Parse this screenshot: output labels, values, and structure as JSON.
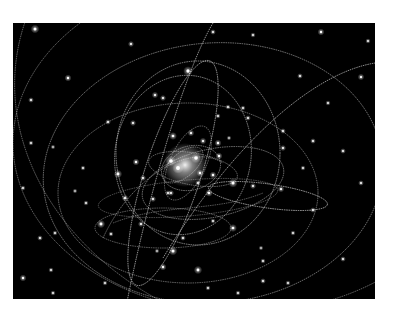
{
  "image": {
    "description": "Simulated stellar orbits around a central galactic black hole, with star trails on a black background",
    "background_color": "#000000",
    "page_color": "#ffffff",
    "frame": {
      "x": 13,
      "y": 23,
      "width": 362,
      "height": 276
    },
    "colors": {
      "orbit": "#cfcfcf",
      "star": "#ffffff",
      "glow": "#ffffff"
    },
    "core": {
      "cx": 172,
      "cy": 142,
      "r": 22
    },
    "orbits": [
      {
        "cx": 178,
        "cy": 145,
        "rx": 30,
        "ry": 22,
        "rot": -15,
        "op": 0.55
      },
      {
        "cx": 175,
        "cy": 140,
        "rx": 18,
        "ry": 40,
        "rot": 25,
        "op": 0.45
      },
      {
        "cx": 180,
        "cy": 146,
        "rx": 45,
        "ry": 16,
        "rot": 10,
        "op": 0.5
      },
      {
        "cx": 170,
        "cy": 142,
        "rx": 24,
        "ry": 12,
        "rot": -40,
        "op": 0.5
      },
      {
        "cx": 185,
        "cy": 130,
        "rx": 82,
        "ry": 92,
        "rot": 0,
        "op": 0.7
      },
      {
        "cx": 170,
        "cy": 132,
        "rx": 68,
        "ry": 80,
        "rot": 10,
        "op": 0.65
      },
      {
        "cx": 200,
        "cy": 160,
        "rx": 72,
        "ry": 34,
        "rot": -12,
        "op": 0.55
      },
      {
        "cx": 255,
        "cy": 173,
        "rx": 60,
        "ry": 12,
        "rot": 8,
        "op": 0.8
      },
      {
        "cx": 160,
        "cy": 150,
        "rx": 28,
        "ry": 118,
        "rot": 18,
        "op": 0.75
      },
      {
        "cx": 175,
        "cy": 170,
        "rx": 130,
        "ry": 90,
        "rot": 0,
        "op": 0.55
      },
      {
        "cx": 200,
        "cy": 150,
        "rx": 170,
        "ry": 130,
        "rot": -5,
        "op": 0.6
      },
      {
        "cx": 230,
        "cy": 120,
        "rx": 230,
        "ry": 170,
        "rot": 0,
        "op": 0.55
      },
      {
        "cx": 300,
        "cy": 80,
        "rx": 300,
        "ry": 240,
        "rot": 10,
        "op": 0.5
      },
      {
        "cx": 150,
        "cy": 205,
        "rx": 68,
        "ry": 20,
        "rot": 0,
        "op": 0.5
      },
      {
        "cx": 175,
        "cy": 175,
        "rx": 90,
        "ry": 18,
        "rot": -5,
        "op": 0.4
      }
    ],
    "paths": [
      {
        "d": "M 110 300 C 130 190 170 50 200 0",
        "op": 0.75
      },
      {
        "d": "M 150 235 C 220 120 300 50 362 40",
        "op": 0.75
      },
      {
        "d": "M 90 215 C 120 150 180 120 210 140",
        "op": 0.55
      },
      {
        "d": "M 100 200 C 150 180 200 190 250 170",
        "op": 0.45
      }
    ],
    "stars": [
      [
        22,
        6,
        2
      ],
      [
        55,
        55,
        1.6
      ],
      [
        118,
        21,
        1.4
      ],
      [
        18,
        77,
        1.3
      ],
      [
        200,
        9,
        1.3
      ],
      [
        308,
        9,
        1.6
      ],
      [
        348,
        54,
        1.5
      ],
      [
        287,
        53,
        1.3
      ],
      [
        315,
        80,
        1.2
      ],
      [
        270,
        125,
        1.4
      ],
      [
        348,
        160,
        1.3
      ],
      [
        290,
        145,
        1.2
      ],
      [
        300,
        187,
        1.3
      ],
      [
        280,
        210,
        1.2
      ],
      [
        250,
        238,
        1.2
      ],
      [
        248,
        225,
        1.1
      ],
      [
        10,
        255,
        1.6
      ],
      [
        38,
        247,
        1.2
      ],
      [
        27,
        215,
        1.3
      ],
      [
        42,
        210,
        1.2
      ],
      [
        10,
        165,
        1.2
      ],
      [
        18,
        120,
        1.2
      ],
      [
        40,
        124,
        1.1
      ],
      [
        62,
        168,
        1.1
      ],
      [
        73,
        180,
        1.2
      ],
      [
        88,
        201,
        1.9
      ],
      [
        150,
        244,
        1.6
      ],
      [
        185,
        247,
        1.9
      ],
      [
        144,
        228,
        1.1
      ],
      [
        220,
        160,
        2.1
      ],
      [
        175,
        48,
        2.2
      ],
      [
        142,
        72,
        1.5
      ],
      [
        150,
        75,
        1.4
      ],
      [
        235,
        95,
        1.3
      ],
      [
        270,
        108,
        1.3
      ],
      [
        216,
        115,
        1.1
      ],
      [
        205,
        93,
        1.2
      ],
      [
        215,
        84,
        1.2
      ],
      [
        220,
        205,
        1.8
      ],
      [
        160,
        228,
        2.0
      ],
      [
        98,
        211,
        1.2
      ],
      [
        128,
        201,
        1.4
      ],
      [
        112,
        175,
        1.5
      ],
      [
        140,
        176,
        1.4
      ],
      [
        155,
        170,
        1.3
      ],
      [
        185,
        160,
        1.3
      ],
      [
        200,
        198,
        1.2
      ],
      [
        105,
        151,
        1.9
      ],
      [
        123,
        139,
        1.6
      ],
      [
        160,
        113,
        1.8
      ],
      [
        178,
        110,
        1.5
      ],
      [
        190,
        118,
        1.5
      ],
      [
        205,
        120,
        1.6
      ],
      [
        206,
        133,
        1.6
      ],
      [
        183,
        135,
        2.4
      ],
      [
        158,
        138,
        2.4
      ],
      [
        165,
        145,
        2.6
      ],
      [
        187,
        150,
        1.6
      ],
      [
        200,
        152,
        1.6
      ],
      [
        196,
        170,
        1.7
      ],
      [
        240,
        163,
        1.4
      ],
      [
        268,
        166,
        1.5
      ],
      [
        158,
        170,
        1.4
      ],
      [
        130,
        155,
        1.4
      ],
      [
        170,
        215,
        1.3
      ],
      [
        120,
        100,
        1.4
      ],
      [
        95,
        99,
        1.3
      ],
      [
        70,
        145,
        1.2
      ],
      [
        300,
        118,
        1.3
      ],
      [
        330,
        128,
        1.3
      ],
      [
        230,
        85,
        1.2
      ],
      [
        250,
        258,
        1.3
      ],
      [
        275,
        260,
        1.2
      ],
      [
        92,
        260,
        1.2
      ],
      [
        40,
        270,
        1.2
      ],
      [
        225,
        270,
        1.2
      ],
      [
        195,
        265,
        1.2
      ],
      [
        330,
        236,
        1.3
      ],
      [
        355,
        18,
        1.2
      ],
      [
        240,
        12,
        1.2
      ]
    ]
  }
}
